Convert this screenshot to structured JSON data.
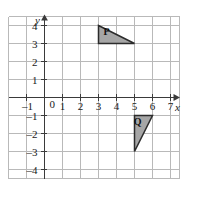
{
  "chart_data": {
    "type": "scatter",
    "title": "",
    "xlabel": "x",
    "ylabel": "y",
    "xlim": [
      -2,
      7.5
    ],
    "ylim": [
      -4.5,
      4.5
    ],
    "grid": true,
    "legend": "none",
    "x_ticks": [
      -1,
      0,
      1,
      2,
      3,
      4,
      5,
      6,
      7
    ],
    "y_ticks": [
      4,
      3,
      2,
      1,
      -1,
      -2,
      -3,
      -4
    ],
    "x_tick_labels": [
      "–1",
      "0",
      "1",
      "2",
      "3",
      "4",
      "5",
      "6",
      "7"
    ],
    "y_tick_labels": [
      "4",
      "3",
      "2",
      "1",
      "–1",
      "–2",
      "–3",
      "–4"
    ],
    "origin_label": "0",
    "shapes": [
      {
        "name": "P",
        "label": "P",
        "kind": "triangle",
        "fill": "#a6a6a6",
        "stroke": "#2b2b2b",
        "vertices": [
          [
            3,
            4
          ],
          [
            5,
            3
          ],
          [
            3,
            3
          ]
        ],
        "label_point": [
          3.45,
          3.45
        ]
      },
      {
        "name": "Q",
        "label": "Q",
        "kind": "triangle",
        "fill": "#a6a6a6",
        "stroke": "#2b2b2b",
        "vertices": [
          [
            5,
            -1
          ],
          [
            6,
            -1
          ],
          [
            5,
            -3
          ]
        ],
        "label_point": [
          5.18,
          -1.55
        ]
      }
    ]
  },
  "axes": {
    "x_axis_name": "x",
    "y_axis_name": "y",
    "x_arrow": "arrow-right",
    "y_arrow": "arrow-up"
  },
  "colors": {
    "grid": "#b9b9b9",
    "axis": "#3a3a3a",
    "shape_fill": "#a6a6a6",
    "shape_stroke": "#2b2b2b",
    "text": "#1a1a1a",
    "background": "#ffffff"
  }
}
